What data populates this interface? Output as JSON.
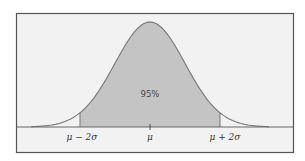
{
  "chart_data": {
    "type": "area",
    "title": "",
    "subtitle": "",
    "xlabel": "",
    "ylabel": "",
    "distribution": "normal",
    "mean": 0,
    "std": 1,
    "x_range": [
      -3.4,
      3.4
    ],
    "shaded_region": {
      "from": -2,
      "to": 2,
      "label": "95%"
    },
    "tick_positions": [
      -2,
      0,
      2
    ],
    "tick_labels": [
      "μ − 2σ",
      "μ",
      "μ + 2σ"
    ],
    "grid": false,
    "legend": "none",
    "annotations": [
      {
        "text": "95%",
        "x": 0,
        "position": "inside shaded area"
      }
    ],
    "colors": {
      "shade": "#c4c4c4",
      "curve": "#777777",
      "frame": "#555555",
      "background": "#f2f2f2"
    }
  },
  "labels": {
    "center_pct": "95%",
    "tick_left": "μ − 2σ",
    "tick_mid": "μ",
    "tick_right": "μ + 2σ"
  }
}
